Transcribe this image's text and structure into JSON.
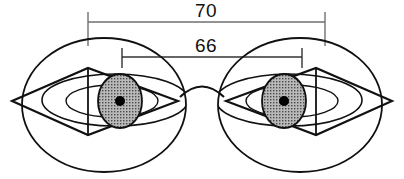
{
  "diagram": {
    "type": "technical-drawing",
    "canvas": {
      "width": 404,
      "height": 179,
      "background": "#ffffff"
    },
    "colors": {
      "outline": "#111111",
      "dimension_line": "#6f6f6f",
      "iris_fill": "#9a9a9a",
      "pupil_fill": "#000000",
      "text": "#111111",
      "background": "#ffffff"
    },
    "dimensions": [
      {
        "id": "outer",
        "label": "70",
        "unit": "mm",
        "meaning": "frame total / lens-center-to-lens-center outer span",
        "x_start": 88,
        "x_end": 325,
        "line_y": 22,
        "tick_top": 12,
        "tick_bottom": 46,
        "text_x": 206,
        "text_y": 17
      },
      {
        "id": "inner",
        "label": "66",
        "unit": "mm",
        "meaning": "pupillary distance (pupil center to pupil center)",
        "x_start": 122,
        "x_end": 302,
        "line_y": 57,
        "tick_top": 48,
        "tick_bottom": 68,
        "text_x": 206,
        "text_y": 52
      }
    ],
    "eyes": [
      {
        "id": "left-eye",
        "side": "left",
        "globe": {
          "cx": 104,
          "cy": 105,
          "rx": 82,
          "ry": 67
        },
        "lid_ellipse": {
          "cx": 115,
          "cy": 100,
          "rx": 73,
          "ry": 26
        },
        "inner_lid_ellipse": {
          "cx": 112,
          "cy": 101,
          "rx": 46,
          "ry": 16
        },
        "diamond": {
          "left_x": 12,
          "right_x": 178,
          "top_y": 68,
          "bottom_y": 135,
          "apex_x": 88,
          "mid_y": 101
        },
        "vertical_axis_x": 88,
        "iris": {
          "cx": 120,
          "cy": 101,
          "rx": 22,
          "ry": 27
        },
        "pupil": {
          "cx": 120,
          "cy": 101,
          "r": 5
        }
      },
      {
        "id": "right-eye",
        "side": "right",
        "globe": {
          "cx": 300,
          "cy": 105,
          "rx": 82,
          "ry": 67
        },
        "lid_ellipse": {
          "cx": 289,
          "cy": 100,
          "rx": 73,
          "ry": 26
        },
        "inner_lid_ellipse": {
          "cx": 292,
          "cy": 101,
          "rx": 46,
          "ry": 16
        },
        "diamond": {
          "left_x": 226,
          "right_x": 392,
          "top_y": 68,
          "bottom_y": 135,
          "apex_x": 316,
          "mid_y": 101
        },
        "vertical_axis_x": 316,
        "iris": {
          "cx": 284,
          "cy": 101,
          "rx": 22,
          "ry": 27
        },
        "pupil": {
          "cx": 284,
          "cy": 101,
          "r": 5
        }
      }
    ],
    "bridge": {
      "id": "nose-bridge",
      "path": "M 180 97 Q 202 76 224 97",
      "description": "arc connecting the two eye circles at the nose bridge"
    }
  }
}
